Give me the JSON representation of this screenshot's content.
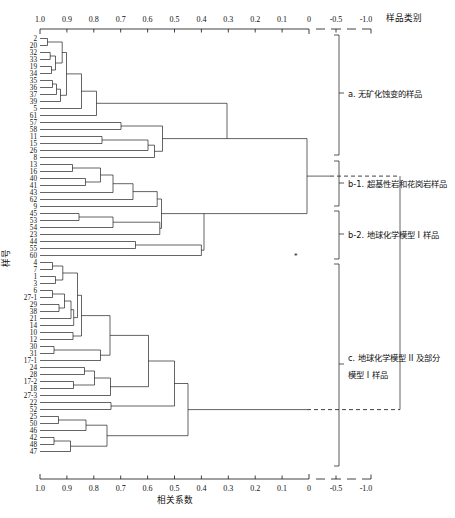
{
  "header": {
    "sample_category_label": "样品类别"
  },
  "axes": {
    "x_title": "相关系数",
    "y_title": "样号",
    "ticks": [
      "1.0",
      "0.9",
      "0.8",
      "0.7",
      "0.6",
      "0.5",
      "0.4",
      "0.3",
      "0.2",
      "0.1",
      "0",
      "-0.5",
      "-1.0"
    ],
    "tick_values": [
      1.0,
      0.9,
      0.8,
      0.7,
      0.6,
      0.5,
      0.4,
      0.3,
      0.2,
      0.1,
      0.0,
      -0.5,
      -1.0
    ],
    "broken_after": "0"
  },
  "groups": [
    {
      "id": "a",
      "label": "a. 无矿化蚀变的样品"
    },
    {
      "id": "b-1",
      "label": "b-1. 超基性岩和花岗岩样品"
    },
    {
      "id": "b-2",
      "label": "b-2. 地球化学模型 I 样品"
    },
    {
      "id": "c",
      "label_line1": "c. 地球化学模型 II 及部分",
      "label_line2": "模型 I 样品"
    }
  ],
  "chart_data": {
    "type": "dendrogram",
    "title": "",
    "xlabel": "相关系数",
    "ylabel": "样号",
    "xlim": [
      1.0,
      -1.0
    ],
    "grid": false,
    "leaf_labels": [
      "2",
      "20",
      "32",
      "33",
      "19",
      "34",
      "35",
      "36",
      "37",
      "39",
      "5",
      "61",
      "57",
      "58",
      "11",
      "15",
      "26",
      "8",
      "13",
      "16",
      "40",
      "41",
      "43",
      "62",
      "9",
      "45",
      "53",
      "54",
      "23",
      "44",
      "55",
      "60",
      "4",
      "7",
      "1",
      "3",
      "6",
      "27-1",
      "29",
      "38",
      "21",
      "14",
      "10",
      "12",
      "30",
      "31",
      "17-1",
      "24",
      "28",
      "17-2",
      "18",
      "27-3",
      "22",
      "52",
      "25",
      "50",
      "46",
      "42",
      "48",
      "47"
    ],
    "leaf_count": 60,
    "merges": [
      {
        "leaves": [
          "2",
          "20"
        ],
        "height": 0.96
      },
      {
        "leaves": [
          "32",
          "33"
        ],
        "height": 0.95
      },
      {
        "leaves": [
          "19",
          "34"
        ],
        "height": 0.945
      },
      {
        "leaves": [
          "32-33",
          "19-34"
        ],
        "height": 0.925
      },
      {
        "leaves": [
          "2-20",
          "32-34"
        ],
        "height": 0.9
      },
      {
        "leaves": [
          "35",
          "36"
        ],
        "height": 0.955
      },
      {
        "leaves": [
          "35-36",
          "37"
        ],
        "height": 0.94
      },
      {
        "leaves": [
          "35-37",
          "39"
        ],
        "height": 0.925
      },
      {
        "leaves": [
          "2-34",
          "35-39"
        ],
        "height": 0.895
      },
      {
        "leaves": [
          "top-cluster",
          "5"
        ],
        "height": 0.84
      },
      {
        "leaves": [
          "5-grp",
          "61"
        ],
        "height": 0.785
      },
      {
        "leaves": [
          "57",
          "58"
        ],
        "height": 0.7
      },
      {
        "leaves": [
          "11",
          "15"
        ],
        "height": 0.77
      },
      {
        "leaves": [
          "11-15",
          "26"
        ],
        "height": 0.6
      },
      {
        "leaves": [
          "11-26",
          "8"
        ],
        "height": 0.575
      },
      {
        "leaves": [
          "57-58",
          "11-8"
        ],
        "height": 0.545
      },
      {
        "leaves": [
          "cluster-a-upper",
          "cluster-a-lower"
        ],
        "height": 0.305
      },
      {
        "leaves": [
          "13",
          "16"
        ],
        "height": 0.88
      },
      {
        "leaves": [
          "40",
          "41"
        ],
        "height": 0.835
      },
      {
        "leaves": [
          "13-16",
          "40-41"
        ],
        "height": 0.775
      },
      {
        "leaves": [
          "13-41",
          "43"
        ],
        "height": 0.73
      },
      {
        "leaves": [
          "13-43",
          "62"
        ],
        "height": 0.655
      },
      {
        "leaves": [
          "13-62",
          "9"
        ],
        "height": 0.565
      },
      {
        "leaves": [
          "45",
          "53"
        ],
        "height": 0.855
      },
      {
        "leaves": [
          "45-53",
          "54"
        ],
        "height": 0.73
      },
      {
        "leaves": [
          "45-54",
          "23"
        ],
        "height": 0.555
      },
      {
        "leaves": [
          "44",
          "55"
        ],
        "height": 0.645
      },
      {
        "leaves": [
          "44-55",
          "60"
        ],
        "height": 0.4
      },
      {
        "leaves": [
          "b1-cluster",
          "b2-cluster"
        ],
        "height": 0.385
      },
      {
        "leaves": [
          "4",
          "7"
        ],
        "height": 0.955
      },
      {
        "leaves": [
          "1",
          "3"
        ],
        "height": 0.945
      },
      {
        "leaves": [
          "4-7",
          "1-3"
        ],
        "height": 0.915
      },
      {
        "leaves": [
          "6",
          "27-1"
        ],
        "height": 0.955
      },
      {
        "leaves": [
          "29",
          "38"
        ],
        "height": 0.93
      },
      {
        "leaves": [
          "6-27-1",
          "29-38"
        ],
        "height": 0.91
      },
      {
        "leaves": [
          "6-38",
          "21"
        ],
        "height": 0.885
      },
      {
        "leaves": [
          "6-21",
          "14"
        ],
        "height": 0.875
      },
      {
        "leaves": [
          "4-3",
          "6-14"
        ],
        "height": 0.86
      },
      {
        "leaves": [
          "10",
          "12"
        ],
        "height": 0.865
      },
      {
        "leaves": [
          "4-14",
          "10-12"
        ],
        "height": 0.845
      },
      {
        "leaves": [
          "30",
          "31"
        ],
        "height": 0.9
      },
      {
        "leaves": [
          "30-31",
          "17-1"
        ],
        "height": 0.775
      },
      {
        "leaves": [
          "big",
          "30-17-1"
        ],
        "height": 0.74
      },
      {
        "leaves": [
          "24",
          "28"
        ],
        "height": 0.835
      },
      {
        "leaves": [
          "17-2",
          "18"
        ],
        "height": 0.86
      },
      {
        "leaves": [
          "24-28",
          "17-2-18"
        ],
        "height": 0.8
      },
      {
        "leaves": [
          "24-18",
          "27-3"
        ],
        "height": 0.745
      },
      {
        "leaves": [
          "c-upper",
          "24-27-3"
        ],
        "height": 0.615
      },
      {
        "leaves": [
          "22",
          "52"
        ],
        "height": 0.735
      },
      {
        "leaves": [
          "c-main",
          "22-52"
        ],
        "height": 0.52
      },
      {
        "leaves": [
          "25",
          "50"
        ],
        "height": 0.93
      },
      {
        "leaves": [
          "25-50",
          "46"
        ],
        "height": 0.83
      },
      {
        "leaves": [
          "42",
          "48"
        ],
        "height": 0.935
      },
      {
        "leaves": [
          "42-48",
          "47"
        ],
        "height": 0.885
      },
      {
        "leaves": [
          "42-47",
          "25-46"
        ],
        "height": 0.755
      },
      {
        "leaves": [
          "c-top",
          "c-bot"
        ],
        "height": 0.44
      },
      {
        "leaves": [
          "root-ab",
          "root-c"
        ],
        "height": -0.6
      }
    ]
  }
}
